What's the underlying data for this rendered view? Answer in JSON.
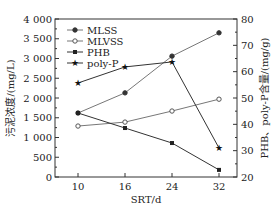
{
  "chart_data": {
    "type": "line",
    "title": "",
    "xlabel": "SRT/d",
    "ylabel": "污泥浓度/(mg/L)",
    "ylabel_right": "PHB、poly-P含量/(mg/g)",
    "categories": [
      10,
      16,
      24,
      32
    ],
    "x_tick_labels": [
      "10",
      "16",
      "24",
      "32"
    ],
    "ylim": [
      0,
      4000
    ],
    "ylim_right": [
      20,
      80
    ],
    "y_tick_labels": [
      "0",
      "500",
      "1 000",
      "1 500",
      "2 000",
      "2 500",
      "3 000",
      "3 500",
      "4 000"
    ],
    "y_ticks": [
      0,
      500,
      1000,
      1500,
      2000,
      2500,
      3000,
      3500,
      4000
    ],
    "y_right_tick_labels": [
      "20",
      "30",
      "40",
      "50",
      "60",
      "70",
      "80"
    ],
    "y_right_ticks": [
      20,
      30,
      40,
      50,
      60,
      70,
      80
    ],
    "grid": false,
    "legend_position": "upper-left",
    "series": [
      {
        "name": "MLSS",
        "axis": "left",
        "marker": "filled-circle",
        "color": "#777777",
        "values": [
          1620,
          2130,
          3060,
          3650
        ]
      },
      {
        "name": "MLVSS",
        "axis": "left",
        "marker": "open-circle",
        "color": "#777777",
        "values": [
          1290,
          1390,
          1670,
          1970
        ]
      },
      {
        "name": "PHB",
        "axis": "right",
        "marker": "filled-square",
        "color": "#333333",
        "values": [
          44.3,
          38.6,
          32.9,
          22.7
        ]
      },
      {
        "name": "poly-P",
        "axis": "right",
        "marker": "star",
        "color": "#333333",
        "values": [
          55.7,
          61.8,
          63.7,
          31.0
        ]
      }
    ]
  }
}
